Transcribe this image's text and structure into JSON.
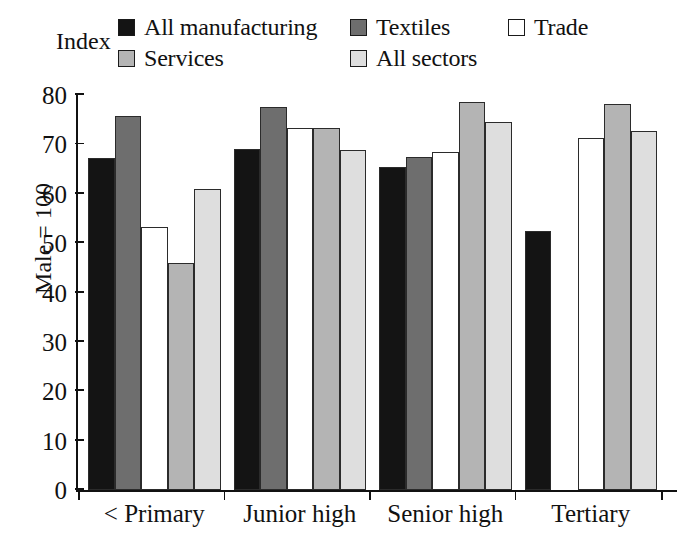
{
  "index_label": "Index",
  "y_axis_title": "Male = 100",
  "legend": {
    "rows": [
      [
        {
          "label": "All manufacturing",
          "color": "#141414",
          "swatch": "legend-swatch-all-manufacturing"
        },
        {
          "label": "Textiles",
          "color": "#6e6e6e",
          "swatch": "legend-swatch-textiles"
        },
        {
          "label": "Trade",
          "color": "#ffffff",
          "swatch": "legend-swatch-trade"
        }
      ],
      [
        {
          "label": "Services",
          "color": "#b4b4b4",
          "swatch": "legend-swatch-services"
        },
        {
          "label": "All sectors",
          "color": "#dedede",
          "swatch": "legend-swatch-all-sectors"
        }
      ]
    ]
  },
  "chart_data": {
    "type": "bar",
    "title": "",
    "subtitle": "",
    "xlabel": "",
    "ylabel": "Male = 100",
    "y_axis_annotation": "Index",
    "ylim": [
      0,
      80
    ],
    "yticks": [
      0,
      10,
      20,
      30,
      40,
      50,
      60,
      70,
      80
    ],
    "ytick_labels": [
      "0",
      "10",
      "20",
      "30",
      "40",
      "50",
      "60",
      "70",
      "80"
    ],
    "grid": false,
    "legend_position": "top",
    "categories": [
      "< Primary",
      "Junior high",
      "Senior high",
      "Tertiary"
    ],
    "series": [
      {
        "name": "All manufacturing",
        "color": "#141414",
        "values": [
          67.3,
          69.0,
          65.5,
          52.4
        ]
      },
      {
        "name": "Textiles",
        "color": "#6e6e6e",
        "values": [
          75.8,
          77.5,
          67.5,
          null
        ]
      },
      {
        "name": "Trade",
        "color": "#ffffff",
        "values": [
          53.3,
          73.3,
          68.5,
          71.2
        ]
      },
      {
        "name": "Services",
        "color": "#b4b4b4",
        "values": [
          46.0,
          73.3,
          78.5,
          78.2
        ]
      },
      {
        "name": "All sectors",
        "color": "#dedede",
        "values": [
          61.0,
          68.8,
          74.5,
          72.8
        ]
      }
    ]
  }
}
